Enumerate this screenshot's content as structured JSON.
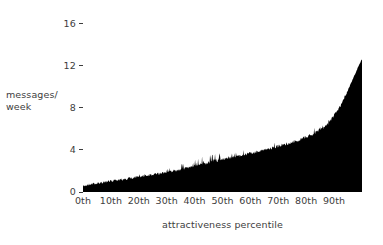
{
  "chart_data": {
    "type": "area",
    "title": "",
    "subtitle": "",
    "xlabel": "attractiveness percentile",
    "ylabel": "messages/\nweek",
    "ylabel_line1": "messages/",
    "ylabel_line2": "week",
    "grid": false,
    "legend": "none",
    "fill_color": "#000000",
    "text_color": "#3d3d3d",
    "background_color": "#ffffff",
    "xlim": [
      0,
      100
    ],
    "ylim": [
      0,
      17.3
    ],
    "yticks": [
      16,
      12,
      8,
      4,
      0
    ],
    "ytick_labels": [
      "16",
      "12",
      "8",
      "4",
      "0"
    ],
    "xticks": [
      0,
      10,
      20,
      30,
      40,
      50,
      60,
      70,
      80,
      90
    ],
    "xtick_labels": [
      "0th",
      "10th",
      "20th",
      "30th",
      "40th",
      "50th",
      "60th",
      "70th",
      "80th",
      "90th"
    ],
    "series_name": "messages per week",
    "x": [
      0,
      1,
      2,
      3,
      4,
      5,
      6,
      7,
      8,
      9,
      10,
      11,
      12,
      13,
      14,
      15,
      16,
      17,
      18,
      19,
      20,
      21,
      22,
      23,
      24,
      25,
      26,
      27,
      28,
      29,
      30,
      31,
      32,
      33,
      34,
      35,
      36,
      37,
      38,
      39,
      40,
      41,
      42,
      43,
      44,
      45,
      46,
      47,
      48,
      49,
      50,
      51,
      52,
      53,
      54,
      55,
      56,
      57,
      58,
      59,
      60,
      61,
      62,
      63,
      64,
      65,
      66,
      67,
      68,
      69,
      70,
      71,
      72,
      73,
      74,
      75,
      76,
      77,
      78,
      79,
      80,
      81,
      82,
      83,
      84,
      85,
      86,
      87,
      88,
      89,
      90,
      91,
      92,
      93,
      94,
      95,
      96,
      97,
      98,
      99,
      100
    ],
    "values": [
      0.55,
      0.62,
      0.68,
      0.72,
      0.78,
      0.82,
      0.86,
      0.9,
      0.95,
      0.98,
      1.02,
      1.06,
      1.1,
      1.14,
      1.18,
      1.22,
      1.26,
      1.3,
      1.34,
      1.38,
      1.42,
      1.46,
      1.5,
      1.55,
      1.59,
      1.63,
      1.68,
      1.72,
      1.77,
      1.82,
      1.87,
      1.92,
      1.97,
      2.02,
      2.08,
      2.14,
      2.2,
      2.26,
      2.32,
      2.38,
      2.45,
      2.52,
      2.58,
      2.64,
      2.7,
      2.76,
      2.82,
      2.88,
      2.95,
      3.0,
      3.06,
      3.12,
      3.18,
      3.24,
      3.3,
      3.36,
      3.42,
      3.48,
      3.54,
      3.6,
      3.66,
      3.72,
      3.78,
      3.85,
      3.92,
      3.98,
      4.05,
      4.12,
      4.19,
      4.26,
      4.33,
      4.4,
      4.48,
      4.56,
      4.64,
      4.72,
      4.8,
      4.9,
      5.0,
      5.1,
      5.2,
      5.32,
      5.45,
      5.6,
      5.75,
      5.9,
      6.1,
      6.3,
      6.55,
      6.85,
      7.2,
      7.6,
      8.05,
      8.55,
      9.1,
      9.7,
      10.3,
      10.9,
      11.5,
      12.1,
      12.6
    ],
    "noise_amplitude": 0.34
  },
  "axes": {
    "y_tick_dash": "-",
    "y_title_lines": [
      "messages/",
      "week"
    ],
    "x_title": "attractiveness percentile"
  }
}
